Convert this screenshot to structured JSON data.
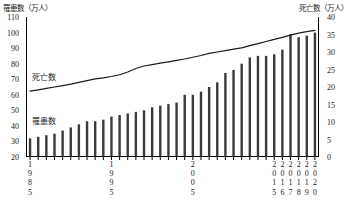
{
  "axis_unit_left": "罹患数（万人）",
  "axis_unit_right": "死亡数（万人）",
  "series_label_line": "死亡数",
  "series_label_bars": "罹患数",
  "chart_data": {
    "type": "bar",
    "title": "",
    "xlabel": "",
    "ylabel": "罹患数（万人）",
    "y2label": "死亡数（万人）",
    "grid": false,
    "legend": "in-plot annotations",
    "ylim": [
      20,
      110
    ],
    "y2lim": [
      0,
      40
    ],
    "yticks": [
      110,
      100,
      90,
      80,
      70,
      60,
      50,
      40,
      30,
      20
    ],
    "y2ticks": [
      40,
      35,
      30,
      25,
      20,
      15,
      10,
      5,
      0
    ],
    "categories": [
      "1985",
      "1986",
      "1987",
      "1988",
      "1989",
      "1990",
      "1991",
      "1992",
      "1993",
      "1994",
      "1995",
      "1996",
      "1997",
      "1998",
      "1999",
      "2000",
      "2001",
      "2002",
      "2003",
      "2004",
      "2005",
      "2006",
      "2007",
      "2008",
      "2009",
      "2010",
      "2011",
      "2012",
      "2013",
      "2014",
      "2015",
      "2016",
      "2017",
      "2018",
      "2019",
      "2020"
    ],
    "xtick_labels_shown": [
      "1985",
      "1995",
      "2005",
      "2015",
      "2016",
      "2017",
      "2018",
      "2019",
      "2020"
    ],
    "series": [
      {
        "name": "罹患数",
        "type": "bar",
        "axis": "left",
        "unit": "万人",
        "color": "#3a3a3a",
        "values": [
          32,
          33,
          34,
          35,
          37,
          39,
          41,
          43,
          43,
          44,
          46,
          47,
          48,
          49,
          50,
          52,
          53,
          54,
          55,
          60,
          60,
          62,
          65,
          68,
          74,
          76,
          80,
          84,
          85,
          85,
          86,
          89,
          99,
          97,
          98,
          100
        ]
      },
      {
        "name": "死亡数",
        "type": "line",
        "axis": "right",
        "unit": "万人",
        "color": "#1a1a1a",
        "values": [
          18.8,
          19.2,
          19.6,
          20.0,
          20.4,
          20.8,
          21.3,
          21.8,
          22.3,
          22.6,
          23.0,
          23.5,
          24.3,
          25.3,
          26.0,
          26.4,
          26.8,
          27.2,
          27.6,
          28.0,
          28.5,
          29.0,
          29.6,
          30.0,
          30.4,
          30.8,
          31.2,
          31.8,
          32.4,
          33.0,
          33.6,
          34.2,
          34.8,
          35.4,
          35.8,
          36.2
        ]
      }
    ]
  }
}
